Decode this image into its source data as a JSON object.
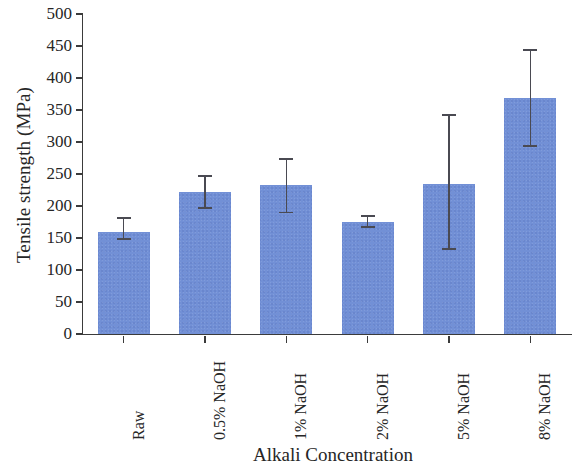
{
  "chart_data": {
    "type": "bar",
    "title": "",
    "subtitle": "",
    "xlabel": "Alkali Concentration",
    "ylabel": "Tensile strength (MPa)",
    "categories": [
      "Raw",
      "0.5% NaOH",
      "1% NaOH",
      "2% NaOH",
      "5% NaOH",
      "8% NaOH"
    ],
    "values": [
      159,
      222,
      233,
      175,
      235,
      369
    ],
    "error_low": [
      148,
      197,
      190,
      167,
      133,
      294
    ],
    "error_high": [
      181,
      247,
      273,
      184,
      342,
      444
    ],
    "error_minus": [
      11,
      25,
      43,
      8,
      102,
      75
    ],
    "error_plus": [
      22,
      25,
      40,
      9,
      107,
      75
    ],
    "ylim": [
      0,
      500
    ],
    "ytick_values": [
      0,
      50,
      100,
      150,
      200,
      250,
      300,
      350,
      400,
      450,
      500
    ],
    "ytick_labels": [
      "0",
      "50",
      "100",
      "150",
      "200",
      "250",
      "300",
      "350",
      "400",
      "450",
      "500"
    ],
    "grid": false,
    "legend": false,
    "legend_position": "none",
    "bar_color": "#7290d6",
    "error_bar_color": "#4a4a52",
    "axis_color": "#3b3b3b",
    "background_color": "#ffffff",
    "xtick_rotation": -90,
    "series": [
      {
        "name": "Tensile strength",
        "values": [
          159,
          222,
          233,
          175,
          235,
          369
        ]
      }
    ]
  }
}
